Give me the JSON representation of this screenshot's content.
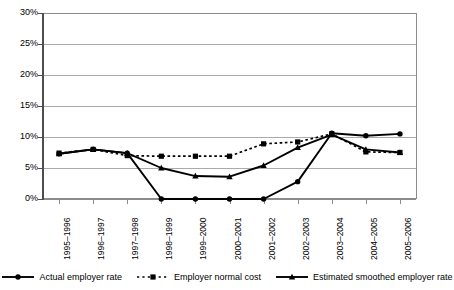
{
  "chart_data": {
    "type": "line",
    "title": "",
    "xlabel": "",
    "ylabel": "",
    "ylim": [
      0,
      30
    ],
    "ytick_labels": [
      "30%",
      "25%",
      "20%",
      "15%",
      "10%",
      "5%",
      "0%"
    ],
    "ytick_values": [
      30,
      25,
      20,
      15,
      10,
      5,
      0
    ],
    "grid": true,
    "legend_position": "bottom",
    "categories": [
      "1995–1996",
      "1996–1997",
      "1997–1998",
      "1998–1999",
      "1999–2000",
      "2000–2001",
      "2001–2002",
      "2002–2003",
      "2003–2004",
      "2004–2005",
      "2005–2006"
    ],
    "series": [
      {
        "name": "Actual employer rate",
        "marker": "circle",
        "line_style": "solid",
        "color": "#000000",
        "values": [
          7.3,
          8.0,
          7.4,
          0.0,
          0.0,
          0.0,
          0.0,
          2.8,
          10.6,
          10.2,
          10.5
        ]
      },
      {
        "name": "Employer normal cost",
        "marker": "square",
        "line_style": "dotted",
        "color": "#000000",
        "values": [
          7.4,
          8.0,
          7.0,
          6.9,
          6.9,
          6.9,
          8.9,
          9.2,
          10.5,
          7.6,
          7.5
        ]
      },
      {
        "name": "Estimated smoothed employer rate",
        "marker": "triangle",
        "line_style": "solid",
        "color": "#000000",
        "values": [
          7.3,
          8.0,
          7.4,
          5.0,
          3.7,
          3.6,
          5.4,
          8.3,
          10.4,
          8.0,
          7.5
        ]
      }
    ]
  },
  "legend": {
    "items": [
      {
        "label": "Actual employer rate",
        "marker": "circle-marker",
        "style": "solid"
      },
      {
        "label": "Employer normal cost",
        "marker": "square-marker",
        "style": "dotted"
      },
      {
        "label": "Estimated smoothed employer rate",
        "marker": "triangle-marker",
        "style": "solid"
      }
    ]
  }
}
